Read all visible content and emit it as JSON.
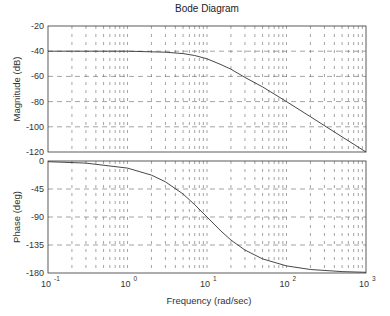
{
  "chart_data": {
    "type": "line",
    "title": "Bode Diagram",
    "xlabel": "Frequency  (rad/sec)",
    "xscale": "log",
    "xlim": [
      0.1,
      1000
    ],
    "x_tick_labels": [
      "10^-1",
      "10^0",
      "10^1",
      "10^2",
      "10^3"
    ],
    "grid": true,
    "panels": [
      {
        "name": "magnitude",
        "ylabel": "Magnitude (dB)",
        "ylim": [
          -120,
          -20
        ],
        "y_ticks": [
          -20,
          -40,
          -60,
          -80,
          -100,
          -120
        ],
        "series": [
          {
            "name": "magnitude",
            "x": [
              0.1,
              0.3,
              1,
              3,
              5,
              7,
              10,
              15,
              20,
              30,
              50,
              100,
              200,
              500,
              1000
            ],
            "values": [
              -40,
              -40,
              -40,
              -40.8,
              -41.9,
              -43.4,
              -46,
              -50.6,
              -54.3,
              -60.8,
              -68.3,
              -80,
              -92,
              -108,
              -120
            ]
          }
        ]
      },
      {
        "name": "phase",
        "ylabel": "Phase (deg)",
        "ylim": [
          -180,
          0
        ],
        "y_ticks": [
          0,
          -45,
          -90,
          -135,
          -180
        ],
        "series": [
          {
            "name": "phase",
            "x": [
              0.1,
              0.3,
              1,
              2,
              3,
              5,
              7,
              10,
              15,
              20,
              30,
              50,
              100,
              200,
              500,
              1000
            ],
            "values": [
              -1.1,
              -3.4,
              -11.4,
              -22.6,
              -33.4,
              -53.1,
              -70.2,
              -90,
              -112.6,
              -126.9,
              -143.1,
              -157.4,
              -168.6,
              -174.3,
              -177.7,
              -178.9
            ]
          }
        ]
      }
    ]
  },
  "labels": {
    "title": "Bode Diagram",
    "xlabel": "Frequency  (rad/sec)",
    "mag_ylabel": "Magnitude (dB)",
    "phase_ylabel": "Phase (deg)"
  }
}
